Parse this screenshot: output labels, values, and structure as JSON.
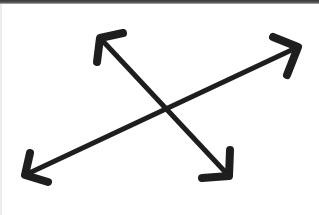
{
  "figure": {
    "description": "Two crossing lines, each with arrowheads at both ends",
    "stroke_color": "#1e1e1e",
    "border_color": "#3a3a3a",
    "background": "#ffffff",
    "icon_name": "move-diagonal-arrows-icon"
  },
  "arrows": [
    {
      "name": "diagonal-arrow-nw-se",
      "from": [
        100,
        38
      ],
      "to": [
        229,
        176
      ],
      "head_start": [
        [
          97,
          62
        ],
        [
          123,
          33
        ]
      ],
      "head_end": [
        [
          230,
          150
        ],
        [
          202,
          178
        ]
      ]
    },
    {
      "name": "diagonal-arrow-sw-ne",
      "from": [
        25,
        175
      ],
      "to": [
        298,
        47
      ],
      "head_start": [
        [
          30,
          153
        ],
        [
          48,
          182
        ]
      ],
      "head_end": [
        [
          273,
          37
        ],
        [
          287,
          75
        ]
      ]
    }
  ]
}
